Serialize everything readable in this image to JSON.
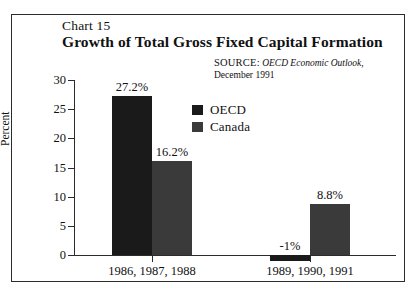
{
  "frame": {
    "border_color": "#2b2b2b"
  },
  "header": {
    "chart_number": "Chart 15",
    "title": "Growth of Total Gross Fixed Capital Formation"
  },
  "source": {
    "label": "SOURCE:",
    "publication": "OECD Economic Outlook",
    "date": ", December 1991"
  },
  "legend": {
    "items": [
      {
        "label": "OECD",
        "color": "#1a1a1a"
      },
      {
        "label": "Canada",
        "color": "#3a3a3a"
      }
    ]
  },
  "axes": {
    "y_title": "Percent",
    "y_ticks": [
      "30",
      "25",
      "20",
      "15",
      "10",
      "5",
      "0"
    ]
  },
  "chart_data": {
    "type": "bar",
    "title": "Growth of Total Gross Fixed Capital Formation",
    "subtitle": "Chart 15",
    "xlabel": "",
    "ylabel": "Percent",
    "ylim": [
      -5,
      30
    ],
    "ytick_step": 5,
    "grid": false,
    "legend_position": "inside-upper-center",
    "categories": [
      "1986, 1987, 1988",
      "1989, 1990, 1991"
    ],
    "series": [
      {
        "name": "OECD",
        "color": "#1a1a1a",
        "values": [
          27.2,
          -1
        ],
        "labels": [
          "27.2%",
          "-1%"
        ]
      },
      {
        "name": "Canada",
        "color": "#3a3a3a",
        "values": [
          16.2,
          8.8
        ],
        "labels": [
          "16.2%",
          "8.8%"
        ]
      }
    ],
    "annotations": [
      "SOURCE: OECD Economic Outlook, December 1991"
    ]
  }
}
